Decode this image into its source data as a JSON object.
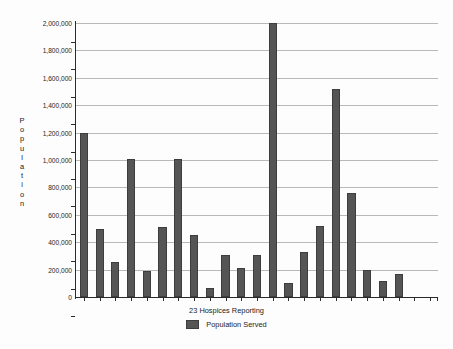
{
  "chart_data": {
    "type": "bar",
    "title": "",
    "xlabel": "23 Hospices Reporting",
    "ylabel": "Population",
    "ylim": [
      0,
      2000000
    ],
    "ytick_labels": [
      "2,000,000",
      "1,800,000",
      "1,600,000",
      "1,400,000",
      "1,200,000",
      "1,000,000",
      "800,000",
      "600,000",
      "400,000",
      "200,000",
      "0"
    ],
    "ytick_values": [
      2000000,
      1800000,
      1600000,
      1400000,
      1200000,
      1000000,
      800000,
      600000,
      400000,
      200000,
      0
    ],
    "grid": true,
    "legend_position": "bottom-center",
    "legend": [
      "Population Served"
    ],
    "series": [
      {
        "name": "Population Served",
        "color": "#555555",
        "values": [
          1200000,
          500000,
          255000,
          1010000,
          190000,
          510000,
          1010000,
          455000,
          65000,
          305000,
          215000,
          310000,
          2000000,
          100000,
          330000,
          520000,
          1520000,
          760000,
          195000,
          115000,
          170000,
          0,
          0
        ]
      }
    ],
    "categories": [
      "1",
      "2",
      "3",
      "4",
      "5",
      "6",
      "7",
      "8",
      "9",
      "10",
      "11",
      "12",
      "13",
      "14",
      "15",
      "16",
      "17",
      "18",
      "19",
      "20",
      "21",
      "22",
      "23"
    ],
    "bar_count": 23
  },
  "axis": {
    "y_title_letters": [
      "P",
      "o",
      "p",
      "u",
      "l",
      "a",
      "t",
      "i",
      "o",
      "n"
    ]
  },
  "colors": {
    "bar": "#555555",
    "bar_border": "#3d3d3d",
    "gridline": "#b9b9b9",
    "axis": "#2b2b2b",
    "background": "#fdfdfd"
  }
}
